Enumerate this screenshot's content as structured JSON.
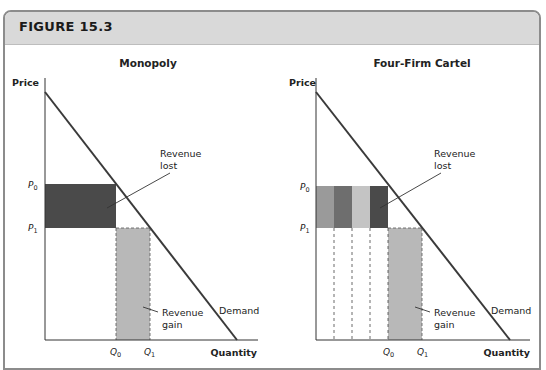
{
  "figure": {
    "title": "FIGURE 15.3"
  },
  "colors": {
    "header_bg": "#d9d9d9",
    "frame_border": "#8c8c8c",
    "demand_line": "#3a3a3a",
    "monopoly_loss": "#4a4a4a",
    "gain_fill": "#b8b8b8",
    "firm_shades": [
      "#9a9a9a",
      "#6e6e6e",
      "#c4c4c4",
      "#4a4a4a"
    ]
  },
  "panels": [
    {
      "title": "Monopoly",
      "y_axis_label": "Price",
      "x_axis_label": "Quantity",
      "p0_label": "P",
      "p0_sub": "0",
      "p1_label": "P",
      "p1_sub": "1",
      "q0_label": "Q",
      "q0_sub": "0",
      "q1_label": "Q",
      "q1_sub": "1",
      "revenue_lost_line1": "Revenue",
      "revenue_lost_line2": "lost",
      "revenue_gain_line1": "Revenue",
      "revenue_gain_line2": "gain",
      "demand_label": "Demand"
    },
    {
      "title": "Four-Firm Cartel",
      "y_axis_label": "Price",
      "x_axis_label": "Quantity",
      "p0_label": "P",
      "p0_sub": "0",
      "p1_label": "P",
      "p1_sub": "1",
      "q0_label": "Q",
      "q0_sub": "0",
      "q1_label": "Q",
      "q1_sub": "1",
      "revenue_lost_line1": "Revenue",
      "revenue_lost_line2": "lost",
      "revenue_gain_line1": "Revenue",
      "revenue_gain_line2": "gain",
      "demand_label": "Demand"
    }
  ]
}
